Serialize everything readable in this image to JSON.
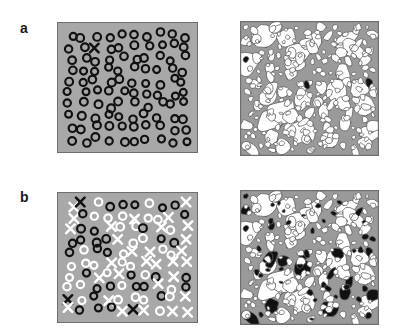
{
  "figure": {
    "kind": "scientific-figure",
    "width": 393,
    "height": 332,
    "background_color": "#ffffff"
  },
  "colors": {
    "field_gray": "#a8a8a8",
    "matrix_gray": "#9a9a9a",
    "grain_white": "#ffffff",
    "marker_black": "#111111",
    "marker_white": "#ffffff",
    "panel_border": "#6e6e6e",
    "label_color": "#1a1a1a"
  },
  "panels": [
    {
      "id": "a",
      "label": "a",
      "label_position": {
        "x": 20,
        "y": 21
      },
      "left": {
        "name": "schematic-dispersed-particles",
        "description": "gray field with black open rings and a single black X marker",
        "background": "#a8a8a8",
        "ring_count": 101,
        "ring_diameter": 9.5,
        "ring_stroke": 2.1,
        "ring_color": "#111111",
        "x_marker_count": 1,
        "x_marker_color": "#111111",
        "x_markers": [
          {
            "x": 34,
            "y": 24,
            "size": 9,
            "color": "#111111"
          }
        ]
      },
      "right": {
        "name": "micrograph-grain-mosaic-sparse",
        "description": "polygonal grain mosaic, white grains in gray matrix, one filled black grain",
        "matrix": "#9a9a9a",
        "grain_fill": "#ffffff",
        "filled_grain_count": 1,
        "filled_grain_color": "#111111"
      }
    },
    {
      "id": "b",
      "label": "b",
      "label_position": {
        "x": 20,
        "y": 190
      },
      "left": {
        "name": "schematic-mixed-particles",
        "description": "gray field with black rings, white rings, white X markers and black X markers",
        "background": "#a8a8a8",
        "ring_diameter": 9.5,
        "ring_stroke": 2.1,
        "black_ring_count": 35,
        "white_ring_count": 35,
        "white_x_count": 30,
        "black_x_count": 3
      },
      "right": {
        "name": "micrograph-grain-mosaic-dense",
        "description": "polygonal grain mosaic, many grains filled solid black",
        "matrix": "#9a9a9a",
        "grain_fill": "#ffffff",
        "filled_grain_count": 46,
        "filled_grain_color": "#111111"
      }
    }
  ],
  "chart_data": {
    "type": "scatter",
    "title": "",
    "xlabel": "",
    "ylabel": "",
    "panel_ids": [
      "a",
      "b"
    ],
    "series": [
      {
        "name": "a-left black rings",
        "panel": "a",
        "side": "left",
        "marker": "open-circle",
        "color": "#111111",
        "count": 101
      },
      {
        "name": "a-left X markers",
        "panel": "a",
        "side": "left",
        "marker": "x",
        "color": "#111111",
        "count": 1
      },
      {
        "name": "a-right filled grains",
        "panel": "a",
        "side": "right",
        "marker": "filled-polygon",
        "color": "#111111",
        "count": 1
      },
      {
        "name": "b-left black rings",
        "panel": "b",
        "side": "left",
        "marker": "open-circle",
        "color": "#111111",
        "count": 35
      },
      {
        "name": "b-left white rings",
        "panel": "b",
        "side": "left",
        "marker": "open-circle",
        "color": "#ffffff",
        "count": 35
      },
      {
        "name": "b-left white X markers",
        "panel": "b",
        "side": "left",
        "marker": "x",
        "color": "#ffffff",
        "count": 30
      },
      {
        "name": "b-left black X markers",
        "panel": "b",
        "side": "left",
        "marker": "x",
        "color": "#111111",
        "count": 3
      },
      {
        "name": "b-right filled grains",
        "panel": "b",
        "side": "right",
        "marker": "filled-polygon",
        "color": "#111111",
        "count": 46
      }
    ],
    "legend": [],
    "grid": false
  }
}
